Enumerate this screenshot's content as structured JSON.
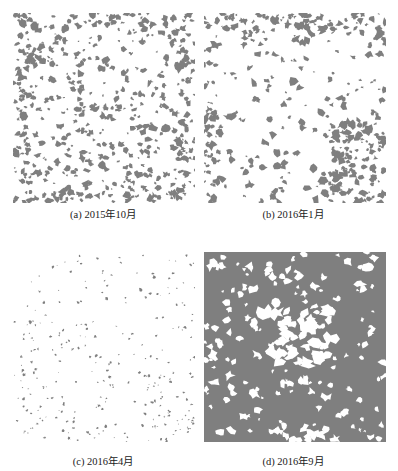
{
  "figure": {
    "panels": [
      {
        "id": "a",
        "caption": "(a) 2015年10月",
        "density": "medium",
        "fill": "#7f7f7f"
      },
      {
        "id": "b",
        "caption": "(b) 2016年1月",
        "density": "low-medium",
        "fill": "#7f7f7f"
      },
      {
        "id": "c",
        "caption": "(c) 2016年4月",
        "density": "sparse",
        "fill": "#7f7f7f"
      },
      {
        "id": "d",
        "caption": "(d) 2016年9月",
        "density": "dense",
        "fill": "#7f7f7f"
      }
    ]
  }
}
